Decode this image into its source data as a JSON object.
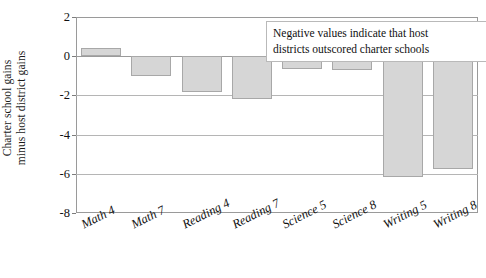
{
  "chart_data": {
    "type": "bar",
    "title": "",
    "xlabel": "",
    "ylabel": "Charter school gains minus host district gains",
    "ylabel_lines": [
      "Charter school gains",
      "minus host district gains"
    ],
    "categories": [
      "Math 4",
      "Math 7",
      "Reading 4",
      "Reading 7",
      "Science 5",
      "Science 8",
      "Writing 5",
      "Writing 8"
    ],
    "values": [
      0.4,
      -1.0,
      -1.85,
      -2.2,
      -0.65,
      -0.7,
      -6.15,
      -5.75
    ],
    "ylim": [
      -8,
      2
    ],
    "yticks": [
      2,
      0,
      -2,
      -4,
      -6,
      -8
    ],
    "ytick_labels": [
      "2",
      "0",
      "-2",
      "-4",
      "-6",
      "-8"
    ],
    "grid": true,
    "legend": "none",
    "annotations": [
      {
        "text": "Negative values indicate that host districts outscored charter schools",
        "lines": [
          "Negative values indicate that host",
          "districts outscored charter schools"
        ],
        "position": "top-right"
      }
    ],
    "bar_fill_color": "#d6d6d6",
    "bar_border_color": "#a8a8a8",
    "gridline_color": "#b5b5b5",
    "axis_color": "#9a9a9a"
  }
}
